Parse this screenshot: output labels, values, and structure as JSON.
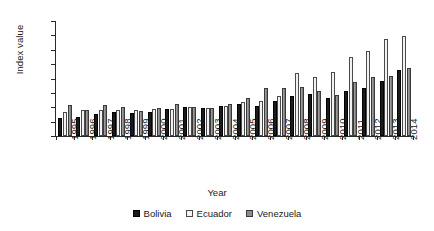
{
  "chart_data": {
    "type": "bar",
    "title": "",
    "xlabel": "Year",
    "ylabel": "Index value",
    "ylim": [
      0,
      400
    ],
    "ytick_step": 50,
    "yticks": [
      0,
      50,
      100,
      150,
      200,
      250,
      300,
      350,
      400
    ],
    "grid": false,
    "legend_position": "bottom",
    "categories": [
      "1995",
      "1996",
      "1997",
      "1998",
      "1999",
      "2000",
      "2001",
      "2002",
      "2003",
      "2004",
      "2005",
      "2006",
      "2007",
      "2008",
      "2009",
      "2010",
      "2011",
      "2012",
      "2013",
      "2014"
    ],
    "series": [
      {
        "name": "Bolivia",
        "color": "#1b1b1b",
        "values": [
          63,
          66,
          75,
          84,
          81,
          84,
          93,
          100,
          97,
          103,
          110,
          105,
          121,
          138,
          146,
          133,
          157,
          168,
          192,
          228
        ]
      },
      {
        "name": "Ecuador",
        "color": "#f2f2f2",
        "values": [
          84,
          89,
          90,
          91,
          90,
          95,
          95,
          100,
          97,
          105,
          117,
          122,
          140,
          218,
          204,
          224,
          274,
          296,
          337,
          348
        ]
      },
      {
        "name": "Venezuela",
        "color": "#8d8d8d",
        "values": [
          108,
          91,
          108,
          101,
          87,
          97,
          113,
          100,
          96,
          111,
          131,
          167,
          167,
          171,
          158,
          141,
          187,
          204,
          210,
          235
        ]
      }
    ]
  },
  "legend": {
    "items": [
      {
        "label": "Bolivia",
        "key": "bolivia"
      },
      {
        "label": "Ecuador",
        "key": "ecuador"
      },
      {
        "label": "Venezuela",
        "key": "venezuela"
      }
    ]
  }
}
